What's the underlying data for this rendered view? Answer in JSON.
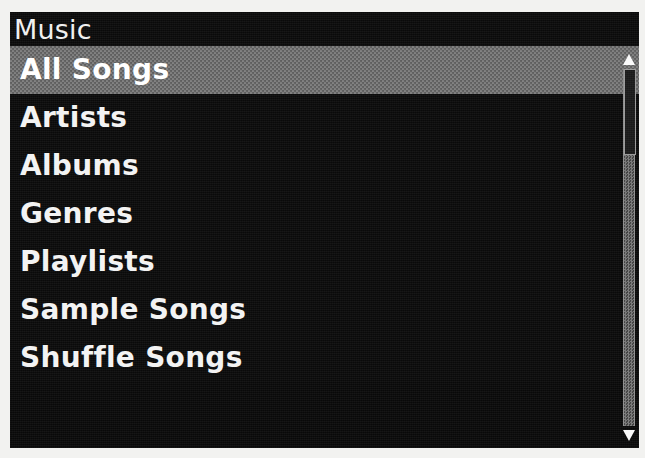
{
  "device": {
    "screen_label": "ipod-lcd-screen"
  },
  "header": {
    "title": "Music"
  },
  "menu": {
    "items": [
      {
        "label": "All Songs",
        "selected": true
      },
      {
        "label": "Artists",
        "selected": false
      },
      {
        "label": "Albums",
        "selected": false
      },
      {
        "label": "Genres",
        "selected": false
      },
      {
        "label": "Playlists",
        "selected": false
      },
      {
        "label": "Sample Songs",
        "selected": false
      },
      {
        "label": "Shuffle Songs",
        "selected": false
      }
    ]
  },
  "scrollbar": {
    "up_arrow_icon": "triangle-up-icon",
    "down_arrow_icon": "triangle-down-icon",
    "thumb_position": "top"
  },
  "colors": {
    "screen_background": "#0a0a0a",
    "text": "#f3f3f3",
    "selection_background": "#6d6d6d",
    "selection_text": "#ffffff",
    "scrollbar_arrow": "#fafafa",
    "bezel": "#f2f2f0"
  }
}
